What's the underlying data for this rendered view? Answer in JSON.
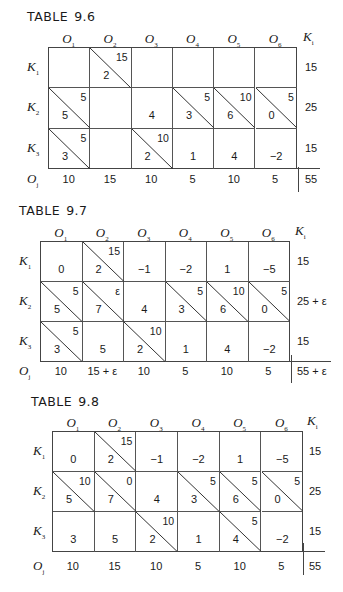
{
  "tables": [
    {
      "title": "TABLE",
      "number": "9.6",
      "col_headers": [
        {
          "base": "O",
          "sub": "1"
        },
        {
          "base": "O",
          "sub": "2"
        },
        {
          "base": "O",
          "sub": "3"
        },
        {
          "base": "O",
          "sub": "4"
        },
        {
          "base": "O",
          "sub": "5"
        },
        {
          "base": "O",
          "sub": "6"
        }
      ],
      "supply_header": {
        "base": "K",
        "sub": "i"
      },
      "row_headers": [
        {
          "base": "K",
          "sub": "1"
        },
        {
          "base": "K",
          "sub": "2"
        },
        {
          "base": "K",
          "sub": "3"
        }
      ],
      "demand_header": {
        "base": "O",
        "sub": "j"
      },
      "cells": [
        [
          {
            "cost": "",
            "alloc": "",
            "diag": false
          },
          {
            "cost": "2",
            "alloc": "15",
            "diag": true
          },
          {
            "cost": "",
            "alloc": "",
            "diag": false
          },
          {
            "cost": "",
            "alloc": "",
            "diag": false
          },
          {
            "cost": "",
            "alloc": "",
            "diag": false
          },
          {
            "cost": "",
            "alloc": "",
            "diag": false
          }
        ],
        [
          {
            "cost": "5",
            "alloc": "5",
            "diag": true
          },
          {
            "cost": "",
            "alloc": "",
            "diag": false
          },
          {
            "cost": "4",
            "alloc": "",
            "diag": false
          },
          {
            "cost": "3",
            "alloc": "5",
            "diag": true
          },
          {
            "cost": "6",
            "alloc": "10",
            "diag": true
          },
          {
            "cost": "0",
            "alloc": "5",
            "diag": true
          }
        ],
        [
          {
            "cost": "3",
            "alloc": "5",
            "diag": true
          },
          {
            "cost": "",
            "alloc": "",
            "diag": false
          },
          {
            "cost": "2",
            "alloc": "10",
            "diag": true
          },
          {
            "cost": "1",
            "alloc": "",
            "diag": false
          },
          {
            "cost": "4",
            "alloc": "",
            "diag": false
          },
          {
            "cost": "−2",
            "alloc": "",
            "diag": false
          }
        ]
      ],
      "supply": [
        "15",
        "25",
        "15"
      ],
      "demand": [
        "10",
        "15",
        "10",
        "5",
        "10",
        "5"
      ],
      "total": "55"
    },
    {
      "title": "TABLE",
      "number": "9.7",
      "col_headers": [
        {
          "base": "O",
          "sub": "1"
        },
        {
          "base": "O",
          "sub": "2"
        },
        {
          "base": "O",
          "sub": "3"
        },
        {
          "base": "O",
          "sub": "4"
        },
        {
          "base": "O",
          "sub": "5"
        },
        {
          "base": "O",
          "sub": "6"
        }
      ],
      "supply_header": {
        "base": "K",
        "sub": "i"
      },
      "row_headers": [
        {
          "base": "K",
          "sub": "1"
        },
        {
          "base": "K",
          "sub": "2"
        },
        {
          "base": "K",
          "sub": "3"
        }
      ],
      "demand_header": {
        "base": "O",
        "sub": "j"
      },
      "cells": [
        [
          {
            "cost": "0",
            "alloc": "",
            "diag": false
          },
          {
            "cost": "2",
            "alloc": "15",
            "diag": true
          },
          {
            "cost": "−1",
            "alloc": "",
            "diag": false
          },
          {
            "cost": "−2",
            "alloc": "",
            "diag": false
          },
          {
            "cost": "1",
            "alloc": "",
            "diag": false
          },
          {
            "cost": "−5",
            "alloc": "",
            "diag": false
          }
        ],
        [
          {
            "cost": "5",
            "alloc": "5",
            "diag": true
          },
          {
            "cost": "7",
            "alloc": "ε",
            "diag": true
          },
          {
            "cost": "4",
            "alloc": "",
            "diag": false
          },
          {
            "cost": "3",
            "alloc": "5",
            "diag": true
          },
          {
            "cost": "6",
            "alloc": "10",
            "diag": true
          },
          {
            "cost": "0",
            "alloc": "5",
            "diag": true
          }
        ],
        [
          {
            "cost": "3",
            "alloc": "5",
            "diag": true
          },
          {
            "cost": "5",
            "alloc": "",
            "diag": false
          },
          {
            "cost": "2",
            "alloc": "10",
            "diag": true
          },
          {
            "cost": "1",
            "alloc": "",
            "diag": false
          },
          {
            "cost": "4",
            "alloc": "",
            "diag": false
          },
          {
            "cost": "−2",
            "alloc": "",
            "diag": false
          }
        ]
      ],
      "supply": [
        "15",
        "25 + ε",
        "15"
      ],
      "demand": [
        "10",
        "15 + ε",
        "10",
        "5",
        "10",
        "5"
      ],
      "total": "55 + ε"
    },
    {
      "title": "TABLE",
      "number": "9.8",
      "col_headers": [
        {
          "base": "O",
          "sub": "1"
        },
        {
          "base": "O",
          "sub": "2"
        },
        {
          "base": "O",
          "sub": "3"
        },
        {
          "base": "O",
          "sub": "4"
        },
        {
          "base": "O",
          "sub": "5"
        },
        {
          "base": "O",
          "sub": "6"
        }
      ],
      "supply_header": {
        "base": "K",
        "sub": "i"
      },
      "row_headers": [
        {
          "base": "K",
          "sub": "1"
        },
        {
          "base": "K",
          "sub": "2"
        },
        {
          "base": "K",
          "sub": "3"
        }
      ],
      "demand_header": {
        "base": "O",
        "sub": "j"
      },
      "cells": [
        [
          {
            "cost": "0",
            "alloc": "",
            "diag": false
          },
          {
            "cost": "2",
            "alloc": "15",
            "diag": true
          },
          {
            "cost": "−1",
            "alloc": "",
            "diag": false
          },
          {
            "cost": "−2",
            "alloc": "",
            "diag": false
          },
          {
            "cost": "1",
            "alloc": "",
            "diag": false
          },
          {
            "cost": "−5",
            "alloc": "",
            "diag": false
          }
        ],
        [
          {
            "cost": "5",
            "alloc": "10",
            "diag": true
          },
          {
            "cost": "7",
            "alloc": "0",
            "diag": true
          },
          {
            "cost": "4",
            "alloc": "",
            "diag": false
          },
          {
            "cost": "3",
            "alloc": "5",
            "diag": true
          },
          {
            "cost": "6",
            "alloc": "5",
            "diag": true
          },
          {
            "cost": "0",
            "alloc": "5",
            "diag": true
          }
        ],
        [
          {
            "cost": "3",
            "alloc": "",
            "diag": false
          },
          {
            "cost": "5",
            "alloc": "",
            "diag": false
          },
          {
            "cost": "2",
            "alloc": "10",
            "diag": true
          },
          {
            "cost": "1",
            "alloc": "",
            "diag": false
          },
          {
            "cost": "4",
            "alloc": "5",
            "diag": true
          },
          {
            "cost": "−2",
            "alloc": "",
            "diag": false
          }
        ]
      ],
      "supply": [
        "15",
        "25",
        "15"
      ],
      "demand": [
        "10",
        "15",
        "10",
        "5",
        "10",
        "5"
      ],
      "total": "55"
    }
  ]
}
